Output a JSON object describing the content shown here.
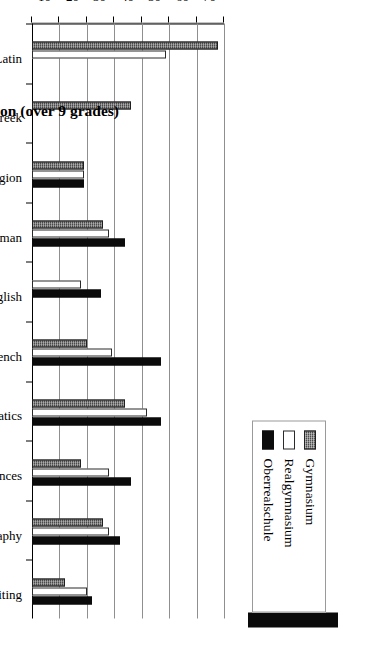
{
  "chart_data": {
    "type": "bar",
    "orientation": "horizontal",
    "title": "",
    "xlabel": "Hours of weekly instruction (over 9 grades)",
    "ylabel": "",
    "xlim": [
      0,
      70
    ],
    "xticks": [
      0,
      10,
      20,
      30,
      40,
      50,
      60,
      70
    ],
    "grid": true,
    "legend_position": "top-right",
    "categories": [
      "Latin",
      "Greek",
      "Religion",
      "German",
      "English",
      "French",
      "Mathematics",
      "Natural Sciences",
      "History/ Geography",
      "Drawing/ Writing"
    ],
    "series": [
      {
        "name": "Gymnasium",
        "color": "#4a4a4a",
        "values": [
          68,
          36,
          19,
          26,
          0,
          20,
          34,
          18,
          26,
          12
        ]
      },
      {
        "name": "Realgymnasium",
        "color": "#ffffff",
        "values": [
          49,
          0,
          19,
          28,
          18,
          29,
          42,
          28,
          28,
          20
        ]
      },
      {
        "name": "Oberrealschule",
        "color": "#0b0b0b",
        "values": [
          0,
          0,
          19,
          34,
          25,
          47,
          47,
          36,
          32,
          22
        ]
      }
    ]
  },
  "legend": {
    "items": [
      {
        "label": "Gymnasium",
        "swatch": "gym"
      },
      {
        "label": "Realgymnasium",
        "swatch": "real"
      },
      {
        "label": "Oberrealschule",
        "swatch": "ober"
      }
    ]
  },
  "axis": {
    "value_title": "Hours of weekly instruction (over 9 grades)",
    "tick_labels": [
      "0",
      "10",
      "20",
      "30",
      "40",
      "50",
      "60",
      "70"
    ]
  },
  "colors": {
    "gymnasium": "#4a4a4a",
    "realgymnasium": "#ffffff",
    "oberrealschule": "#0b0b0b",
    "gridline": "#8f8f8f",
    "axis": "#000000"
  }
}
